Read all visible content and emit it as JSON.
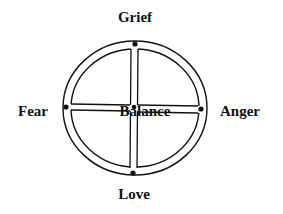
{
  "diagram": {
    "type": "medicine-wheel",
    "labels": {
      "top": "Grief",
      "bottom": "Love",
      "left": "Fear",
      "right": "Anger",
      "center": "Balance"
    },
    "colors": {
      "stroke": "#111111",
      "background": "#ffffff"
    }
  }
}
